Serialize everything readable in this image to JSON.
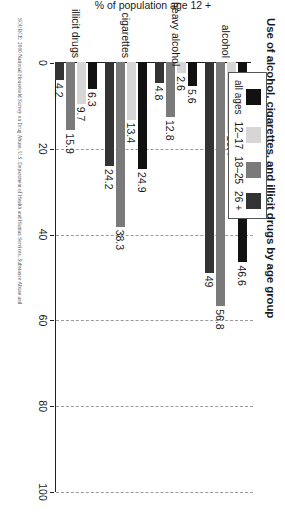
{
  "chart_data": {
    "type": "bar",
    "title": "Use of alcohol, cigarettes, and illicit drugs by age group",
    "xlabel": "",
    "ylabel": "% of population age 12 +",
    "categories": [
      "alcohol",
      "heavy alcohol",
      "cigarettes",
      "illicit drugs"
    ],
    "series": [
      {
        "name": "all ages",
        "color": "#111111",
        "values": [
          46.6,
          5.6,
          24.9,
          6.3
        ]
      },
      {
        "name": "12–17",
        "color": "#d6d6d6",
        "values": [
          16.4,
          2.6,
          13.4,
          9.7
        ]
      },
      {
        "name": "18–25",
        "color": "#7a7a7a",
        "values": [
          56.8,
          12.8,
          38.3,
          15.9
        ]
      },
      {
        "name": "26 +",
        "color": "#333333",
        "values": [
          49,
          4.8,
          24.2,
          4.2
        ]
      }
    ],
    "value_labels": [
      [
        "46.6",
        "16.4",
        "56.8",
        "49"
      ],
      [
        "5.6",
        "2.6",
        "12.8",
        "4.8"
      ],
      [
        "24.9",
        "13.4",
        "38.3",
        "24.2"
      ],
      [
        "6.3",
        "9.7",
        "15.9",
        "4.2"
      ]
    ],
    "ylim": [
      0,
      100
    ],
    "yticks": [
      0,
      20,
      40,
      60,
      80,
      100
    ],
    "ytick_labels": [
      "0",
      "20",
      "40",
      "60",
      "80",
      "100"
    ],
    "grid": true,
    "grid_axis": "y",
    "legend_position": "top-left"
  },
  "legend": {
    "items": [
      {
        "label": "all ages",
        "color": "#111111"
      },
      {
        "label": "12–17",
        "color": "#d6d6d6"
      },
      {
        "label": "18–25",
        "color": "#7a7a7a"
      },
      {
        "label": "26 +",
        "color": "#333333"
      }
    ]
  },
  "source": {
    "text": "SOURCE: 2000 National Household Survey on Drug Abuse, U.S. Department of Health and Human Services, Substance Abuse and"
  }
}
